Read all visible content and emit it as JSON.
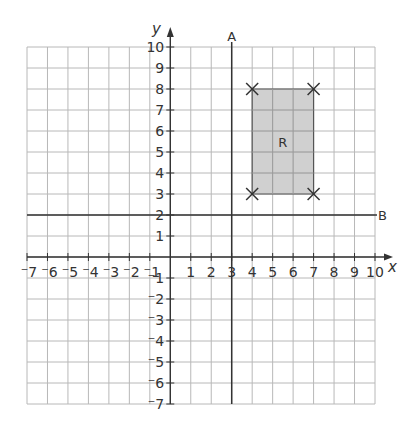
{
  "diagram": {
    "x_axis": {
      "label": "x",
      "min": -7,
      "max": 10,
      "ticks": [
        "-7",
        "-6",
        "-5",
        "-4",
        "-3",
        "-2",
        "-1",
        "1",
        "2",
        "3",
        "4",
        "5",
        "6",
        "7",
        "8",
        "9",
        "10"
      ]
    },
    "y_axis": {
      "label": "y",
      "min": -7,
      "max": 10,
      "ticks": [
        "10",
        "9",
        "8",
        "7",
        "6",
        "5",
        "4",
        "3",
        "2",
        "1",
        "-1",
        "-2",
        "-3",
        "-4",
        "-5",
        "-6",
        "-7"
      ]
    },
    "lines": [
      {
        "name": "A",
        "equation": "x = 3"
      },
      {
        "name": "B",
        "equation": "y = 2"
      }
    ],
    "shape": {
      "label": "R",
      "fill": "#c8c8c8",
      "vertices": [
        [
          4,
          3
        ],
        [
          4,
          8
        ],
        [
          7,
          8
        ],
        [
          7,
          3
        ]
      ],
      "vertex_marker": "cross"
    },
    "colors": {
      "grid": "#b8b8b8",
      "axis": "#333333",
      "line": "#333333"
    }
  }
}
